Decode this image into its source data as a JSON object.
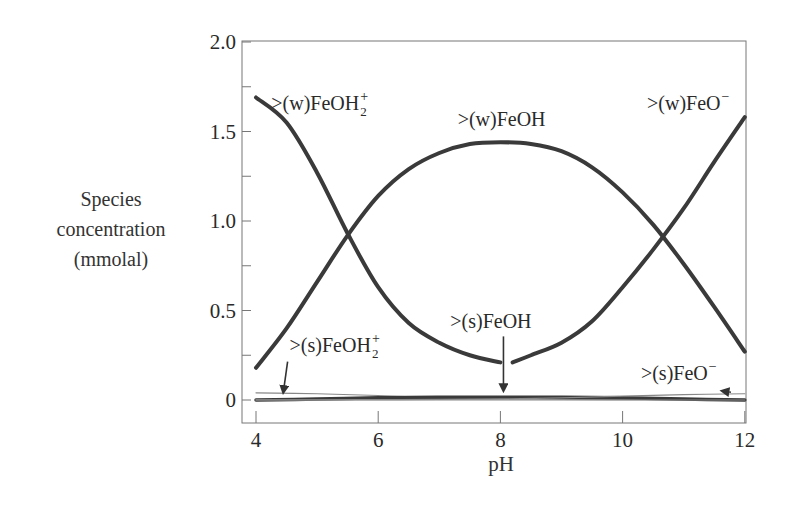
{
  "chart_data": {
    "type": "line",
    "title": "",
    "xlabel": "pH",
    "ylabel_lines": [
      "Species",
      "concentration",
      "(mmolal)"
    ],
    "xlim": [
      4,
      12
    ],
    "ylim": [
      0,
      2.0
    ],
    "x_ticks": [
      {
        "value": 4,
        "label": "4"
      },
      {
        "value": 6,
        "label": "6"
      },
      {
        "value": 8,
        "label": "8"
      },
      {
        "value": 10,
        "label": "10"
      },
      {
        "value": 12,
        "label": "12"
      }
    ],
    "y_ticks": [
      {
        "value": 0,
        "label": "0"
      },
      {
        "value": 0.25,
        "label": ""
      },
      {
        "value": 0.5,
        "label": "0.5"
      },
      {
        "value": 0.75,
        "label": ""
      },
      {
        "value": 1.0,
        "label": "1.0"
      },
      {
        "value": 1.25,
        "label": ""
      },
      {
        "value": 1.5,
        "label": "1.5"
      },
      {
        "value": 1.75,
        "label": ""
      },
      {
        "value": 2.0,
        "label": "2.0"
      }
    ],
    "grid": false,
    "series": [
      {
        "name": ">(w)FeOH2+",
        "weight": "thick",
        "x": [
          4.0,
          4.5,
          5.0,
          5.5,
          6.0,
          6.5,
          7.0,
          7.5,
          8.0
        ],
        "y": [
          1.69,
          1.55,
          1.27,
          0.93,
          0.63,
          0.43,
          0.32,
          0.25,
          0.21
        ]
      },
      {
        "name": ">(w)FeOH",
        "weight": "thick",
        "x": [
          4.0,
          4.5,
          5.0,
          5.5,
          6.0,
          6.5,
          7.0,
          7.5,
          8.0,
          8.5,
          9.0,
          9.5,
          10.0,
          10.5,
          11.0,
          11.5,
          12.0
        ],
        "y": [
          0.18,
          0.4,
          0.66,
          0.92,
          1.14,
          1.29,
          1.38,
          1.43,
          1.44,
          1.43,
          1.39,
          1.3,
          1.16,
          0.98,
          0.76,
          0.52,
          0.27
        ]
      },
      {
        "name": ">(w)FeO-",
        "weight": "thick",
        "x": [
          8.2,
          8.5,
          9.0,
          9.5,
          10.0,
          10.5,
          11.0,
          11.5,
          12.0
        ],
        "y": [
          0.21,
          0.25,
          0.32,
          0.44,
          0.63,
          0.84,
          1.07,
          1.33,
          1.58
        ]
      },
      {
        "name": ">(s)FeOH2+",
        "weight": "thin",
        "x": [
          4.0,
          5.0,
          6.0,
          7.0,
          8.0,
          9.0,
          10.0,
          11.0,
          12.0
        ],
        "y": [
          0.04,
          0.035,
          0.025,
          0.012,
          0.006,
          0.003,
          0.002,
          0.001,
          0.001
        ]
      },
      {
        "name": ">(s)FeOH",
        "weight": "thick-low",
        "x": [
          4.0,
          5.0,
          6.0,
          7.0,
          8.0,
          9.0,
          10.0,
          11.0,
          12.0
        ],
        "y": [
          0.0,
          0.005,
          0.012,
          0.015,
          0.016,
          0.015,
          0.012,
          0.005,
          0.0
        ]
      },
      {
        "name": ">(s)FeO-",
        "weight": "thin",
        "x": [
          4.0,
          5.0,
          6.0,
          7.0,
          8.0,
          9.0,
          10.0,
          11.0,
          12.0
        ],
        "y": [
          0.001,
          0.001,
          0.002,
          0.003,
          0.006,
          0.012,
          0.022,
          0.03,
          0.035
        ]
      },
      {
        "name": "baseline",
        "weight": "thin",
        "x": [
          4.0,
          12.0
        ],
        "y": [
          0.0,
          0.0
        ]
      }
    ],
    "annotations": [
      {
        "text": ">(w)FeOH",
        "sub": "2",
        "sup": "+",
        "x": 4.25,
        "y": 1.62
      },
      {
        "text": ">(w)FeOH",
        "sub": "",
        "sup": "",
        "x": 7.3,
        "y": 1.53
      },
      {
        "text": ">(w)FeO",
        "sub": "",
        "sup": "−",
        "x": 10.4,
        "y": 1.62
      },
      {
        "text": ">(s)FeOH",
        "sub": "",
        "sup": "",
        "x": 7.18,
        "y": 0.4,
        "arrow_to": [
          8.05,
          0.06
        ]
      },
      {
        "text": ">(s)FeOH",
        "sub": "2",
        "sup": "+",
        "x": 4.55,
        "y": 0.27,
        "arrow_to": [
          4.45,
          0.05
        ]
      },
      {
        "text": ">(s)FeO",
        "sub": "",
        "sup": "−",
        "x": 10.3,
        "y": 0.11,
        "arrow_to": [
          11.65,
          0.05
        ]
      }
    ]
  }
}
